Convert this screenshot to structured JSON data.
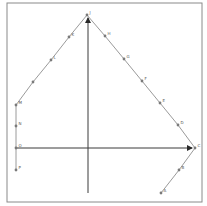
{
  "diagram": {
    "title": "",
    "label_confidence": "low: labels are a few px wide and blurry; letters are best guesses, not verified",
    "colors": {
      "frame": "#8a8a8a",
      "path": "#9a9a9a",
      "axes": "#3a3a3a",
      "points": "#7a7a7a"
    },
    "frame": {
      "x": 7,
      "y": 3,
      "w": 195,
      "h": 199
    },
    "axes": {
      "vertical": {
        "x": 88,
        "y_from": 193,
        "y_to": 18,
        "arrow": "up"
      },
      "horizontal": {
        "y": 148,
        "x_from": 16,
        "x_to": 192,
        "arrow": "right"
      },
      "origin": {
        "x": 88,
        "y": 148
      }
    },
    "points": [
      {
        "label": "A",
        "x": 161,
        "y": 193
      },
      {
        "label": "B",
        "x": 179,
        "y": 170
      },
      {
        "label": "C",
        "x": 195,
        "y": 148
      },
      {
        "label": "D",
        "x": 178,
        "y": 125
      },
      {
        "label": "E",
        "x": 160,
        "y": 103
      },
      {
        "label": "F",
        "x": 142,
        "y": 81
      },
      {
        "label": "G",
        "x": 124,
        "y": 59
      },
      {
        "label": "H",
        "x": 105,
        "y": 36
      },
      {
        "label": "J",
        "x": 87,
        "y": 15
      },
      {
        "label": "K",
        "x": 69,
        "y": 37
      },
      {
        "label": "L",
        "x": 51,
        "y": 60
      },
      {
        "label": "",
        "x": 33,
        "y": 82
      },
      {
        "label": "M",
        "x": 16,
        "y": 105
      },
      {
        "label": "N",
        "x": 16,
        "y": 126
      },
      {
        "label": "O",
        "x": 16,
        "y": 148
      },
      {
        "label": "P",
        "x": 16,
        "y": 170
      }
    ]
  }
}
